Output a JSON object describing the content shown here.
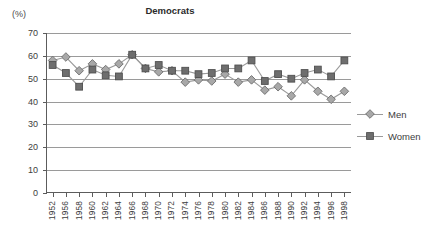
{
  "chart_data": {
    "type": "line",
    "title": "Democrats",
    "xlabel": "",
    "ylabel": "(%)",
    "ylim": [
      0,
      70
    ],
    "ytick_step": 10,
    "yticks": [
      70,
      60,
      50,
      40,
      30,
      20,
      10,
      0
    ],
    "grid": true,
    "legend_position": "right",
    "categories": [
      "1952",
      "1956",
      "1958",
      "1960",
      "1962",
      "1964",
      "1966",
      "1968",
      "1970",
      "1972",
      "1974",
      "1976",
      "1978",
      "1980",
      "1982",
      "1984",
      "1986",
      "1988",
      "1990",
      "1992",
      "1994",
      "1996",
      "1998"
    ],
    "series": [
      {
        "name": "Men",
        "marker": "diamond",
        "color": "#a8a8a8",
        "line_color": "#9a9a9a",
        "values": [
          58.0,
          59.5,
          53.5,
          56.5,
          54.0,
          56.5,
          60.5,
          54.5,
          53.0,
          53.5,
          48.5,
          49.5,
          49.0,
          52.0,
          48.5,
          49.5,
          45.0,
          46.5,
          42.5,
          49.5,
          44.5,
          41.0,
          44.5
        ]
      },
      {
        "name": "Women",
        "marker": "square",
        "color": "#6e6e6e",
        "line_color": "#9a9a9a",
        "values": [
          56.0,
          52.5,
          46.5,
          54.0,
          51.5,
          51.0,
          60.5,
          54.5,
          56.0,
          53.5,
          53.5,
          52.0,
          52.5,
          54.5,
          54.5,
          58.0,
          49.0,
          52.0,
          50.0,
          52.5,
          54.0,
          51.0,
          58.0
        ]
      }
    ]
  },
  "legend": {
    "items": [
      {
        "label": "Men"
      },
      {
        "label": "Women"
      }
    ]
  },
  "axis": {
    "unit_label": "(%)"
  }
}
